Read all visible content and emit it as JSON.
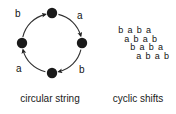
{
  "figure": {
    "background_color": "#ffffff",
    "ink_color": "#121212"
  },
  "circular_panel": {
    "caption": "circular string",
    "node_color": "#1a1a1a",
    "circle_stroke": "#303030",
    "nodes": [
      {
        "name": "top",
        "cx": 52,
        "cy": 13,
        "r": 5.2
      },
      {
        "name": "right",
        "cx": 82,
        "cy": 43,
        "r": 5.2
      },
      {
        "name": "bottom",
        "cx": 52,
        "cy": 73,
        "r": 5.2
      },
      {
        "name": "left",
        "cx": 22,
        "cy": 43,
        "r": 5.2
      }
    ],
    "circle": {
      "cx": 52,
      "cy": 43,
      "r": 30
    },
    "edges": [
      {
        "id": "left-to-top",
        "label": "b",
        "from": "left",
        "to": "top"
      },
      {
        "id": "top-to-right",
        "label": "a",
        "from": "top",
        "to": "right"
      },
      {
        "id": "right-to-bottom",
        "label": "b",
        "from": "right",
        "to": "bottom"
      },
      {
        "id": "bottom-to-left",
        "label": "a",
        "from": "bottom",
        "to": "left"
      }
    ]
  },
  "shifts_panel": {
    "caption": "cyclic shifts",
    "rows": [
      {
        "text": "b a b a",
        "indent": 0
      },
      {
        "text": "a b a b",
        "indent": 1
      },
      {
        "text": "b a b a",
        "indent": 2
      },
      {
        "text": "a b a b",
        "indent": 3
      }
    ]
  }
}
